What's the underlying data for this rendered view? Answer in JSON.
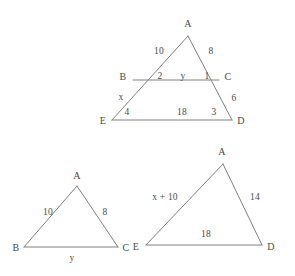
{
  "figure": {
    "stroke_color": "#808080",
    "text_color": "#4a4a4a",
    "background_color": "#ffffff",
    "stroke_width": 1
  },
  "diagrams": [
    {
      "id": "main-nested-triangle",
      "description": "Triangle AED with segment BC parallel to ED",
      "vertices": [
        {
          "name": "A",
          "label": "A",
          "x": 188,
          "y": 36,
          "label_x": 188,
          "label_y": 24
        },
        {
          "name": "B",
          "label": "B",
          "x": 133,
          "y": 80,
          "label_x": 123,
          "label_y": 77
        },
        {
          "name": "C",
          "label": "C",
          "x": 219,
          "y": 80,
          "label_x": 228,
          "label_y": 77
        },
        {
          "name": "E",
          "label": "E",
          "x": 112,
          "y": 120,
          "label_x": 103,
          "label_y": 121
        },
        {
          "name": "D",
          "label": "D",
          "x": 232,
          "y": 120,
          "label_x": 241,
          "label_y": 121
        }
      ],
      "edges": [
        {
          "name": "A-B-E",
          "from": "A",
          "to": "E"
        },
        {
          "name": "A-C-D",
          "from": "A",
          "to": "D"
        },
        {
          "name": "B-C",
          "from": "B",
          "to": "C"
        },
        {
          "name": "E-D",
          "from": "E",
          "to": "D"
        }
      ],
      "measures": [
        {
          "name": "AB",
          "text": "10",
          "x": 159,
          "y": 52
        },
        {
          "name": "AC",
          "text": "8",
          "x": 211,
          "y": 52
        },
        {
          "name": "angle-B",
          "text": "2",
          "x": 160,
          "y": 77
        },
        {
          "name": "BC",
          "text": "y",
          "x": 183,
          "y": 77
        },
        {
          "name": "angle-C",
          "text": "1",
          "x": 207,
          "y": 77
        },
        {
          "name": "BE",
          "text": "x",
          "x": 121,
          "y": 98
        },
        {
          "name": "CD",
          "text": "6",
          "x": 234,
          "y": 99
        },
        {
          "name": "angle-E",
          "text": "4",
          "x": 127,
          "y": 113
        },
        {
          "name": "ED",
          "text": "18",
          "x": 182,
          "y": 113
        },
        {
          "name": "angle-D",
          "text": "3",
          "x": 214,
          "y": 113
        }
      ]
    },
    {
      "id": "small-triangle-abc",
      "description": "Triangle ABC with sides 10, 8 and base y",
      "vertices": [
        {
          "name": "A",
          "label": "A",
          "x": 77,
          "y": 186,
          "label_x": 77,
          "label_y": 176
        },
        {
          "name": "B",
          "label": "B",
          "x": 24,
          "y": 247,
          "label_x": 16,
          "label_y": 248
        },
        {
          "name": "C",
          "label": "C",
          "x": 118,
          "y": 247,
          "label_x": 126,
          "label_y": 248
        }
      ],
      "edges": [
        {
          "name": "A-B",
          "from": "A",
          "to": "B"
        },
        {
          "name": "A-C",
          "from": "A",
          "to": "C"
        },
        {
          "name": "B-C",
          "from": "B",
          "to": "C"
        }
      ],
      "measures": [
        {
          "name": "AB",
          "text": "10",
          "x": 48,
          "y": 213
        },
        {
          "name": "AC",
          "text": "8",
          "x": 105,
          "y": 213
        },
        {
          "name": "BC",
          "text": "y",
          "x": 72,
          "y": 259
        }
      ]
    },
    {
      "id": "large-triangle-aed",
      "description": "Triangle AED with sides x + 10, 14 and base 18",
      "vertices": [
        {
          "name": "A",
          "label": "A",
          "x": 223,
          "y": 164,
          "label_x": 222,
          "label_y": 152
        },
        {
          "name": "E",
          "label": "E",
          "x": 146,
          "y": 245,
          "label_x": 136,
          "label_y": 247
        },
        {
          "name": "D",
          "label": "D",
          "x": 262,
          "y": 245,
          "label_x": 271,
          "label_y": 247
        }
      ],
      "edges": [
        {
          "name": "A-E",
          "from": "A",
          "to": "E"
        },
        {
          "name": "A-D",
          "from": "A",
          "to": "D"
        },
        {
          "name": "E-D",
          "from": "E",
          "to": "D"
        }
      ],
      "measures": [
        {
          "name": "AE",
          "text": "x + 10",
          "x": 165,
          "y": 198
        },
        {
          "name": "AD",
          "text": "14",
          "x": 255,
          "y": 198
        },
        {
          "name": "ED",
          "text": "18",
          "x": 206,
          "y": 235
        }
      ]
    }
  ]
}
